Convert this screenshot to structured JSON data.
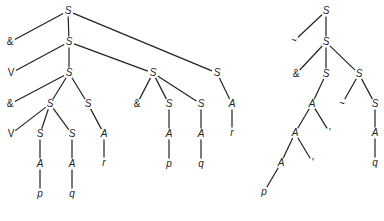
{
  "diagram": {
    "type": "parse-trees",
    "line_color": "#222222",
    "trees": [
      {
        "id": "left-tree",
        "nodes": [
          {
            "id": "L0",
            "label": "S",
            "x": 68,
            "y": 11
          },
          {
            "id": "L1",
            "label": "&",
            "x": 10,
            "y": 42,
            "sym": true
          },
          {
            "id": "L2",
            "label": "S",
            "x": 69,
            "y": 42
          },
          {
            "id": "L3",
            "label": "V",
            "x": 11,
            "y": 73,
            "sym": true
          },
          {
            "id": "L4",
            "label": "S",
            "x": 69,
            "y": 73
          },
          {
            "id": "L5",
            "label": "S",
            "x": 153,
            "y": 73
          },
          {
            "id": "L6",
            "label": "S",
            "x": 217,
            "y": 73
          },
          {
            "id": "L7",
            "label": "&",
            "x": 10,
            "y": 104,
            "sym": true
          },
          {
            "id": "L8",
            "label": "S",
            "x": 50,
            "y": 104
          },
          {
            "id": "L9",
            "label": "S",
            "x": 88,
            "y": 104
          },
          {
            "id": "L10",
            "label": "&",
            "x": 137,
            "y": 104,
            "sym": true
          },
          {
            "id": "L11",
            "label": "S",
            "x": 169,
            "y": 104
          },
          {
            "id": "L12",
            "label": "S",
            "x": 201,
            "y": 104
          },
          {
            "id": "L13",
            "label": "A",
            "x": 232,
            "y": 104
          },
          {
            "id": "L14",
            "label": "V",
            "x": 11,
            "y": 134,
            "sym": true
          },
          {
            "id": "L15",
            "label": "S",
            "x": 40,
            "y": 134
          },
          {
            "id": "L16",
            "label": "S",
            "x": 72,
            "y": 134
          },
          {
            "id": "L17",
            "label": "A",
            "x": 104,
            "y": 134
          },
          {
            "id": "L18",
            "label": "A",
            "x": 169,
            "y": 134
          },
          {
            "id": "L19",
            "label": "A",
            "x": 201,
            "y": 134
          },
          {
            "id": "L20",
            "label": "r",
            "x": 232,
            "y": 133
          },
          {
            "id": "L21",
            "label": "A",
            "x": 40,
            "y": 164
          },
          {
            "id": "L22",
            "label": "A",
            "x": 72,
            "y": 164
          },
          {
            "id": "L23",
            "label": "r",
            "x": 104,
            "y": 163
          },
          {
            "id": "L24",
            "label": "p",
            "x": 169,
            "y": 164
          },
          {
            "id": "L25",
            "label": "q",
            "x": 201,
            "y": 164
          },
          {
            "id": "L26",
            "label": "p",
            "x": 40,
            "y": 194
          },
          {
            "id": "L27",
            "label": "q",
            "x": 72,
            "y": 194
          }
        ],
        "edges": [
          [
            "L0",
            "L1"
          ],
          [
            "L0",
            "L2"
          ],
          [
            "L0",
            "L6"
          ],
          [
            "L2",
            "L3"
          ],
          [
            "L2",
            "L4"
          ],
          [
            "L2",
            "L5"
          ],
          [
            "L4",
            "L7"
          ],
          [
            "L4",
            "L8"
          ],
          [
            "L4",
            "L9"
          ],
          [
            "L5",
            "L10"
          ],
          [
            "L5",
            "L11"
          ],
          [
            "L5",
            "L12"
          ],
          [
            "L6",
            "L13"
          ],
          [
            "L8",
            "L14"
          ],
          [
            "L8",
            "L15"
          ],
          [
            "L8",
            "L16"
          ],
          [
            "L9",
            "L17"
          ],
          [
            "L11",
            "L18"
          ],
          [
            "L12",
            "L19"
          ],
          [
            "L13",
            "L20"
          ],
          [
            "L15",
            "L21"
          ],
          [
            "L16",
            "L22"
          ],
          [
            "L17",
            "L23"
          ],
          [
            "L18",
            "L24"
          ],
          [
            "L19",
            "L25"
          ],
          [
            "L21",
            "L26"
          ],
          [
            "L22",
            "L27"
          ]
        ]
      },
      {
        "id": "right-tree",
        "nodes": [
          {
            "id": "R0",
            "label": "S",
            "x": 326,
            "y": 11
          },
          {
            "id": "R1",
            "label": "~",
            "x": 294,
            "y": 41,
            "sym": true
          },
          {
            "id": "R2",
            "label": "S",
            "x": 326,
            "y": 42
          },
          {
            "id": "R3",
            "label": "&",
            "x": 296,
            "y": 74,
            "sym": true
          },
          {
            "id": "R4",
            "label": "S",
            "x": 326,
            "y": 74
          },
          {
            "id": "R5",
            "label": "S",
            "x": 359,
            "y": 74
          },
          {
            "id": "R6",
            "label": "A",
            "x": 312,
            "y": 104
          },
          {
            "id": "R7",
            "label": "~",
            "x": 342,
            "y": 104,
            "sym": true
          },
          {
            "id": "R8",
            "label": "S",
            "x": 375,
            "y": 104
          },
          {
            "id": "R9",
            "label": "A",
            "x": 295,
            "y": 133
          },
          {
            "id": "R10",
            "label": "'",
            "x": 330,
            "y": 133,
            "sym": true
          },
          {
            "id": "R11",
            "label": "A",
            "x": 375,
            "y": 133
          },
          {
            "id": "R12",
            "label": "A",
            "x": 281,
            "y": 163
          },
          {
            "id": "R13",
            "label": "'",
            "x": 313,
            "y": 163,
            "sym": true
          },
          {
            "id": "R14",
            "label": "q",
            "x": 375,
            "y": 163
          },
          {
            "id": "R15",
            "label": "p",
            "x": 264,
            "y": 192
          }
        ],
        "edges": [
          [
            "R0",
            "R1"
          ],
          [
            "R0",
            "R2"
          ],
          [
            "R2",
            "R3"
          ],
          [
            "R2",
            "R4"
          ],
          [
            "R2",
            "R5"
          ],
          [
            "R4",
            "R6"
          ],
          [
            "R5",
            "R7"
          ],
          [
            "R5",
            "R8"
          ],
          [
            "R6",
            "R9"
          ],
          [
            "R6",
            "R10"
          ],
          [
            "R8",
            "R11"
          ],
          [
            "R9",
            "R12"
          ],
          [
            "R9",
            "R13"
          ],
          [
            "R11",
            "R14"
          ],
          [
            "R12",
            "R15"
          ]
        ]
      }
    ]
  }
}
